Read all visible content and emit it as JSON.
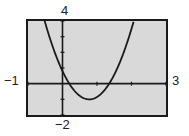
{
  "chart_data": {
    "type": "line",
    "title": "",
    "xlabel": "",
    "ylabel": "",
    "xlim": [
      -1,
      3
    ],
    "ylim": [
      -2,
      4
    ],
    "x_tick_step": 1,
    "y_tick_step": 1,
    "grid": false,
    "axis_labels": {
      "xmin": "−1",
      "xmax": "3",
      "ymin": "−2",
      "ymax": "4"
    },
    "series": [
      {
        "name": "parabola",
        "equation": "y = 3x^2 - 4.65x + 0.8",
        "x": [
          -0.5,
          -0.25,
          0,
          0.2,
          0.5,
          0.775,
          1.0,
          1.35,
          1.75,
          2.0,
          2.4
        ],
        "y": [
          3.875,
          2.15,
          0.8,
          0.0,
          -0.78,
          -0.99,
          -0.85,
          0.0,
          1.85,
          3.5,
          6.92
        ]
      }
    ],
    "colors": {
      "background": "#d9d9d9",
      "frame": "#1a1a1a",
      "curve": "#1a1a1a"
    }
  }
}
